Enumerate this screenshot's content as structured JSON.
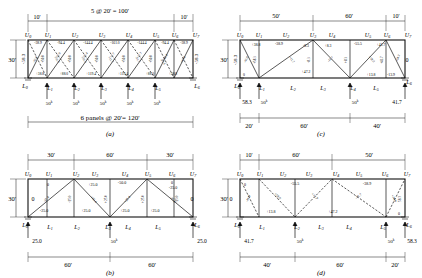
{
  "figure": {
    "panels": [
      "a",
      "b",
      "c",
      "d"
    ],
    "units": {
      "force": "k",
      "length": "ft"
    }
  },
  "panel_a": {
    "caption": "(a)",
    "top_dims": [
      "10'",
      "5 @ 20' = 100'",
      "10'"
    ],
    "left_dim": "30'",
    "bottom_dim": "6 panels @ 20' = 120'",
    "vertical_label": "-58.3",
    "vertical_label_right": "-58.3",
    "top_joints": [
      "U0",
      "U1",
      "U2",
      "U3",
      "U4",
      "U5",
      "U6",
      "U7"
    ],
    "bottom_joints": [
      "L0",
      "L1",
      "L2",
      "L3",
      "L4",
      "L5",
      "L6"
    ],
    "loads": [
      "50",
      "50",
      "50",
      "50",
      "50"
    ],
    "load_unit": "k",
    "top_chord": [
      "-38.9",
      "-94.4",
      "-144.4",
      "-161.0",
      "-144.4",
      "-94.4",
      "-38.9"
    ],
    "bottom_chord": [
      "+38.8",
      "+88.0",
      "+119.4",
      "+119.4",
      "+88.0",
      "+38.8"
    ],
    "diagonals": [
      "-65.0",
      "-55.9",
      "-35.4",
      "-11.7",
      "+11.7",
      "+35.4",
      "+55.9",
      "+65.0"
    ],
    "verticals": [
      "+50.0",
      "+50.0",
      "+50.0",
      "+50.0",
      "+50.0"
    ]
  },
  "panel_b": {
    "caption": "(b)",
    "top_dims": [
      "30'",
      "60'",
      "30'"
    ],
    "left_dim": "30'",
    "bottom_dims": [
      "60'",
      "60'"
    ],
    "top_joints": [
      "U0",
      "U1",
      "U2",
      "U3",
      "U4",
      "U5",
      "U6",
      "U7"
    ],
    "bottom_joints": [
      "L0",
      "L1",
      "L2",
      "L3",
      "L4",
      "L5",
      "L6"
    ],
    "load": "50",
    "load_unit": "k",
    "reaction_left": "25.0",
    "reaction_right": "25.0",
    "zero_left": "0",
    "zero_right": "0",
    "top_chord": [
      "0",
      "+25.0",
      "-50.0",
      "-25.0",
      "0"
    ],
    "bottom_chord": [
      "-25.0",
      "+25.0",
      "+25.0",
      "+25.0"
    ],
    "diagonals": [
      "-35.4",
      "+35.4",
      "+35.4",
      "-35.4"
    ],
    "verticals": [
      "-25.0",
      "+25.0",
      "+25.0",
      "-25.0"
    ]
  },
  "panel_c": {
    "caption": "(c)",
    "top_dims": [
      "50'",
      "60'",
      "10'"
    ],
    "left_dim": "30'",
    "bottom_dims": [
      "20'",
      "60'",
      "40'"
    ],
    "vertical_label": "-58.3",
    "top_joints": [
      "U0",
      "U1",
      "U2",
      "U3",
      "U4",
      "U5",
      "U6",
      "U7"
    ],
    "bottom_joints": [
      "L0",
      "L1",
      "L2",
      "L3",
      "L4",
      "L5",
      "L6"
    ],
    "loads": [
      "50",
      "50"
    ],
    "load_unit": "k",
    "reaction_left": "58.3",
    "reaction_right": "41.7",
    "zero_right": "0",
    "top_chord": [
      "+38.8",
      "-38.9",
      "-8.3",
      "+8.3",
      "-55.5",
      "+41.7"
    ],
    "bottom_chord": [
      "0",
      "+47.2",
      "+13.8",
      "-13.9"
    ],
    "diagonals": [
      "-65.0",
      "-11.7",
      "+11.7",
      "+59.0"
    ],
    "verticals": [
      "+58.3",
      "-8.3",
      "+8.3",
      "+41.7",
      "-58.3"
    ]
  },
  "panel_d": {
    "caption": "(d)",
    "top_dims": [
      "10'",
      "60'",
      "50'"
    ],
    "left_dim": "30'",
    "bottom_dims": [
      "40'",
      "60'",
      "20'"
    ],
    "vertical_label": "0",
    "vertical_label_right": "58.3",
    "top_joints": [
      "U0",
      "U1",
      "U2",
      "U3",
      "U4",
      "U5",
      "U6",
      "U7"
    ],
    "bottom_joints": [
      "L0",
      "L1",
      "L2",
      "L3",
      "L4",
      "L5",
      "L6"
    ],
    "loads": [
      "50",
      "50"
    ],
    "load_unit": "k",
    "reaction_left": "41.7",
    "reaction_right": "58.3",
    "zero_left": "0",
    "zero_right": "0",
    "top_chord": [
      "0",
      "-55.5",
      "-38.9"
    ],
    "bottom_chord": [
      "+13.8",
      "+47.2"
    ],
    "diagonals": [
      "+59.0",
      "+11.7",
      "-11.7",
      "+70.0"
    ],
    "verticals": [
      "-41.9",
      "+58.3"
    ]
  }
}
